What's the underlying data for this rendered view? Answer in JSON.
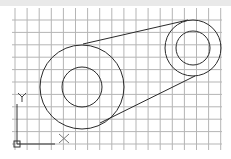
{
  "drawing": {
    "title": "Belt drive sketch",
    "grid": {
      "color": "#b5b5b5",
      "columns": 18,
      "rows": 11
    },
    "ucs": {
      "x_label": "X",
      "y_label": "Y",
      "color": "#333333"
    },
    "pulleys": [
      {
        "name": "large-pulley",
        "outer_radius_units": 3.5,
        "inner_radius_units": 1.7
      },
      {
        "name": "small-pulley",
        "outer_radius_units": 2.3,
        "inner_radius_units": 1.4
      }
    ],
    "belt": {
      "segments": 2
    },
    "line_color": "#2a2a2a"
  }
}
